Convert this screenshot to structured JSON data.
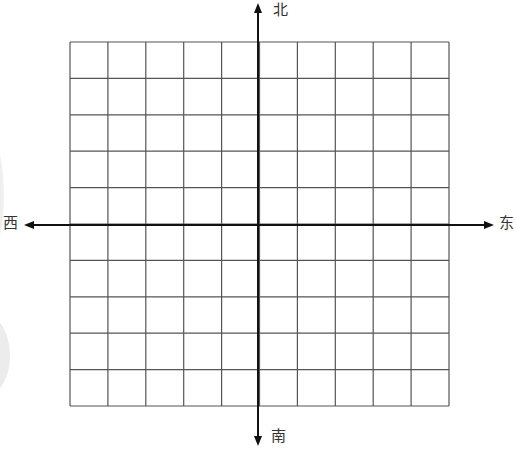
{
  "diagram": {
    "type": "compass-grid",
    "grid": {
      "columns": 10,
      "rows": 10,
      "left": 70,
      "top": 42,
      "right": 449,
      "bottom": 406,
      "line_color": "#555555"
    },
    "axes": {
      "origin_x": 258,
      "origin_y": 225,
      "color": "#111111"
    },
    "directions": {
      "north": "北",
      "south": "南",
      "west": "西",
      "east": "东"
    }
  }
}
